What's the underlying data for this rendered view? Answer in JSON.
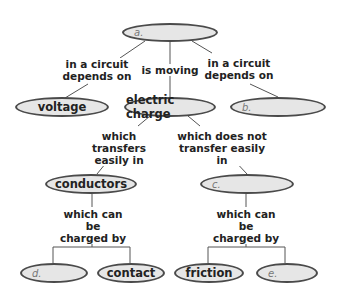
{
  "concept_map": {
    "nodes": {
      "a": {
        "text": "a.",
        "type": "blank"
      },
      "voltage": {
        "text": "voltage",
        "type": "filled"
      },
      "electric_charge": {
        "text": "electric charge",
        "type": "filled"
      },
      "b": {
        "text": "b.",
        "type": "blank"
      },
      "conductors": {
        "text": "conductors",
        "type": "filled"
      },
      "c": {
        "text": "c.",
        "type": "blank"
      },
      "d": {
        "text": "d.",
        "type": "blank"
      },
      "contact": {
        "text": "contact",
        "type": "filled"
      },
      "friction": {
        "text": "friction",
        "type": "filled"
      },
      "e": {
        "text": "e.",
        "type": "blank"
      }
    },
    "links": {
      "a_to_voltage": "in a circuit depends on",
      "a_to_charge": "is moving",
      "a_to_b": "in a circuit depends on",
      "charge_to_conductors": "which transfers easily in",
      "charge_to_c": "which does not transfer easily in",
      "conductors_to_children": "which can be charged by",
      "c_to_children": "which can be charged by"
    },
    "link_lines": {
      "a_to_voltage_1": "in a circuit",
      "a_to_voltage_2": "depends on",
      "a_to_b_1": "in a circuit",
      "a_to_b_2": "depends on",
      "charge_to_conductors_1": "which transfers",
      "charge_to_conductors_2": "easily in",
      "charge_to_c_1": "which does not",
      "charge_to_c_2": "transfer easily in",
      "conductors_children_1": "which can be",
      "conductors_children_2": "charged by",
      "c_children_1": "which can be",
      "c_children_2": "charged by"
    }
  },
  "colors": {
    "node_fill": "#e6e6e6",
    "node_border": "#4a4a4a",
    "line": "#555555",
    "text": "#222222"
  }
}
